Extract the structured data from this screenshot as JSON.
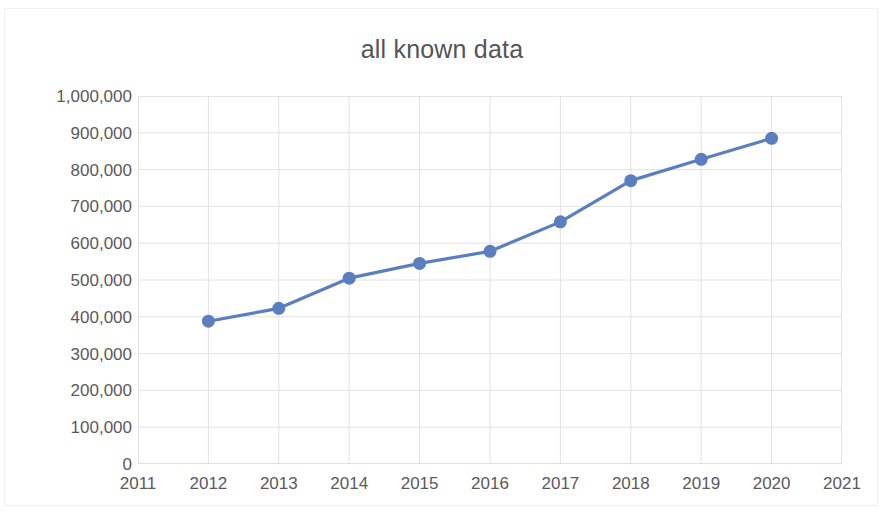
{
  "chart_data": {
    "type": "line",
    "title": "all known data",
    "xlabel": "",
    "ylabel": "",
    "x": [
      2012,
      2013,
      2014,
      2015,
      2016,
      2017,
      2018,
      2019,
      2020
    ],
    "values": [
      388000,
      423000,
      505000,
      545000,
      578000,
      658000,
      770000,
      828000,
      885000
    ],
    "series": [
      {
        "name": "all known data",
        "values": [
          388000,
          423000,
          505000,
          545000,
          578000,
          658000,
          770000,
          828000,
          885000
        ]
      }
    ],
    "x_tick_labels": [
      "2011",
      "2012",
      "2013",
      "2014",
      "2015",
      "2016",
      "2017",
      "2018",
      "2019",
      "2020",
      "2021"
    ],
    "x_tick_values": [
      2011,
      2012,
      2013,
      2014,
      2015,
      2016,
      2017,
      2018,
      2019,
      2020,
      2021
    ],
    "y_tick_labels": [
      "1,000,000",
      "900,000",
      "800,000",
      "700,000",
      "600,000",
      "500,000",
      "400,000",
      "300,000",
      "200,000",
      "100,000",
      "0"
    ],
    "y_tick_values": [
      1000000,
      900000,
      800000,
      700000,
      600000,
      500000,
      400000,
      300000,
      200000,
      100000,
      0
    ],
    "xlim": [
      2011,
      2021
    ],
    "ylim": [
      0,
      1000000
    ],
    "grid": true,
    "legend": false,
    "legend_position": "none",
    "marker": "circle",
    "colors": {
      "line": "#5b7fbe",
      "marker": "#5b7fbe",
      "grid": "#e2e2e2",
      "axis": "#d4d4d4",
      "text": "#5a5a5b",
      "title_text": "#555556",
      "background": "#ffffff"
    }
  }
}
